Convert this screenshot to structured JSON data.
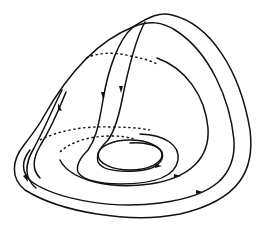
{
  "diagram": {
    "type": "phase-portrait-surface",
    "colors": {
      "stroke": "#111111",
      "background": "#ffffff"
    },
    "elements": {
      "outer_dome_curve": "solid",
      "inner_dome_curve": "solid",
      "descending_trajectories": 2,
      "nested_closed_orbits": 4,
      "hidden_segments": "dashed",
      "arrowheads": 7
    },
    "labels": []
  }
}
